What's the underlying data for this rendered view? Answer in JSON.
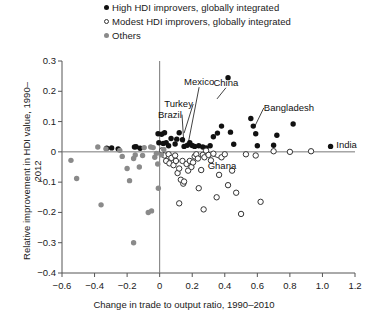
{
  "legend": {
    "position": "top",
    "items": [
      {
        "marker": "filled-circle-icon",
        "label": "High HDI improvers, globally integrated",
        "color": "#111111"
      },
      {
        "marker": "open-circle-icon",
        "label": "Modest HDI improvers, globally integrated",
        "color": "#ffffff"
      },
      {
        "marker": "gray-circle-icon",
        "label": "Others",
        "color": "#8a8a8a"
      }
    ]
  },
  "chart_data": {
    "type": "scatter",
    "title": "",
    "xlabel": "Change in trade to output ratio, 1990–2010",
    "ylabel": "Relative improvement in HDI value, 1990–2012",
    "xlim": [
      -0.6,
      1.2
    ],
    "ylim": [
      -0.4,
      0.3
    ],
    "xticks": [
      -0.6,
      -0.4,
      -0.2,
      0,
      0.2,
      0.4,
      0.6,
      0.8,
      1.0,
      1.2
    ],
    "xticklabels": [
      "−0.6",
      "−0.4",
      "−0.2",
      "0",
      "0.2",
      "0.4",
      "0.6",
      "0.8",
      "1.0",
      "1.2"
    ],
    "yticks": [
      0.3,
      0.2,
      0.1,
      0,
      -0.1,
      -0.2,
      -0.3,
      -0.4
    ],
    "yticklabels": [
      "0.3",
      "0.2",
      "0.1",
      "0",
      "−0.1",
      "−0.2",
      "−0.3",
      "−0.4"
    ],
    "grid": false,
    "reference_lines": {
      "x": 0,
      "y": 0
    },
    "series": [
      {
        "name": "High HDI improvers, globally integrated",
        "marker": "filled-circle",
        "color": "#111111",
        "points": [
          [
            -0.325,
            0.012
          ],
          [
            -0.295,
            0.013
          ],
          [
            -0.255,
            0.01
          ],
          [
            -0.155,
            0.016
          ],
          [
            -0.145,
            0.017
          ],
          [
            -0.12,
            0.012
          ],
          [
            -0.01,
            0.06
          ],
          [
            0.012,
            0.058
          ],
          [
            0.03,
            0.063
          ],
          [
            -0.005,
            0.03
          ],
          [
            0.022,
            0.028
          ],
          [
            0.04,
            0.03
          ],
          [
            0.055,
            0.02
          ],
          [
            0.07,
            0.044
          ],
          [
            0.095,
            0.026
          ],
          [
            0.105,
            0.042
          ],
          [
            0.12,
            0.063
          ],
          [
            0.14,
            0.04
          ],
          [
            0.15,
            0.018
          ],
          [
            0.17,
            0.022
          ],
          [
            0.185,
            0.03
          ],
          [
            0.2,
            0.021
          ],
          [
            0.215,
            0.018
          ],
          [
            0.24,
            0.02
          ],
          [
            0.265,
            0.016
          ],
          [
            0.285,
            0.013
          ],
          [
            0.31,
            0.02
          ],
          [
            0.33,
            0.05
          ],
          [
            0.355,
            0.062
          ],
          [
            0.38,
            0.085
          ],
          [
            0.42,
            0.245
          ],
          [
            0.435,
            0.065
          ],
          [
            0.455,
            0.025
          ],
          [
            0.56,
            0.11
          ],
          [
            0.575,
            0.085
          ],
          [
            0.59,
            0.06
          ],
          [
            0.6,
            0.02
          ],
          [
            0.7,
            0.022
          ],
          [
            0.72,
            0.055
          ],
          [
            0.82,
            0.092
          ],
          [
            1.05,
            0.018
          ]
        ]
      },
      {
        "name": "Modest HDI improvers, globally integrated",
        "marker": "open-circle",
        "color": "#ffffff",
        "points": [
          [
            0.015,
            0.005
          ],
          [
            0.03,
            -0.012
          ],
          [
            0.04,
            -0.03
          ],
          [
            0.055,
            -0.008
          ],
          [
            0.06,
            -0.038
          ],
          [
            0.072,
            -0.02
          ],
          [
            0.085,
            -0.044
          ],
          [
            0.095,
            -0.012
          ],
          [
            0.1,
            -0.03
          ],
          [
            0.11,
            -0.07
          ],
          [
            0.12,
            -0.055
          ],
          [
            0.13,
            -0.092
          ],
          [
            0.14,
            -0.03
          ],
          [
            0.145,
            -0.105
          ],
          [
            0.15,
            -0.098
          ],
          [
            0.165,
            -0.04
          ],
          [
            0.175,
            -0.062
          ],
          [
            0.185,
            -0.03
          ],
          [
            0.195,
            -0.05
          ],
          [
            0.205,
            -0.035
          ],
          [
            0.215,
            -0.015
          ],
          [
            0.225,
            -0.008
          ],
          [
            0.235,
            -0.022
          ],
          [
            0.24,
            -0.12
          ],
          [
            0.255,
            -0.06
          ],
          [
            0.265,
            -0.01
          ],
          [
            0.275,
            -0.018
          ],
          [
            0.285,
            0.004
          ],
          [
            0.3,
            -0.01
          ],
          [
            0.315,
            -0.028
          ],
          [
            0.33,
            -0.006
          ],
          [
            0.35,
            -0.15
          ],
          [
            0.365,
            -0.076
          ],
          [
            0.38,
            -0.018
          ],
          [
            0.4,
            -0.008
          ],
          [
            0.42,
            -0.11
          ],
          [
            0.445,
            -0.062
          ],
          [
            0.47,
            -0.135
          ],
          [
            0.5,
            -0.205
          ],
          [
            0.53,
            -0.008
          ],
          [
            0.59,
            -0.012
          ],
          [
            0.62,
            -0.165
          ],
          [
            0.7,
            0.002
          ],
          [
            0.8,
            0.0
          ],
          [
            0.93,
            0.002
          ],
          [
            0.12,
            -0.17
          ],
          [
            0.27,
            -0.19
          ]
        ]
      },
      {
        "name": "Others",
        "marker": "gray-circle",
        "color": "#8a8a8a",
        "points": [
          [
            -0.545,
            -0.028
          ],
          [
            -0.51,
            -0.088
          ],
          [
            -0.38,
            0.016
          ],
          [
            -0.33,
            0.01
          ],
          [
            -0.245,
            0.005
          ],
          [
            -0.23,
            -0.015
          ],
          [
            -0.2,
            -0.055
          ],
          [
            -0.185,
            -0.095
          ],
          [
            -0.16,
            -0.022
          ],
          [
            -0.15,
            -0.01
          ],
          [
            -0.125,
            -0.05
          ],
          [
            -0.105,
            -0.012
          ],
          [
            -0.095,
            0.014
          ],
          [
            -0.055,
            0.016
          ],
          [
            -0.04,
            0.014
          ],
          [
            -0.03,
            -0.018
          ],
          [
            -0.02,
            -0.005
          ],
          [
            -0.012,
            -0.04
          ],
          [
            -0.008,
            -0.12
          ],
          [
            -0.07,
            -0.2
          ],
          [
            -0.05,
            -0.195
          ],
          [
            -0.16,
            -0.3
          ],
          [
            -0.36,
            -0.175
          ],
          [
            0.01,
            -0.01
          ],
          [
            0.025,
            0.008
          ]
        ]
      }
    ],
    "annotations": [
      {
        "text": "Mexico",
        "label_x": 0.15,
        "label_y": 0.23,
        "point_x": 0.178,
        "point_y": 0.035
      },
      {
        "text": "China",
        "label_x": 0.33,
        "label_y": 0.228,
        "point_x": 0.352,
        "point_y": 0.175
      },
      {
        "text": "Turkey",
        "label_x": 0.028,
        "label_y": 0.158,
        "point_x": 0.15,
        "point_y": 0.062
      },
      {
        "text": "Brazil",
        "label_x": -0.01,
        "label_y": 0.123,
        "point_x": 0.148,
        "point_y": 0.03
      },
      {
        "text": "Bangladesh",
        "label_x": 0.64,
        "label_y": 0.145,
        "point_x": 0.585,
        "point_y": 0.085
      },
      {
        "text": "India",
        "label_x": 1.085,
        "label_y": 0.022,
        "point_x": 1.05,
        "point_y": 0.018
      },
      {
        "text": "Ghana",
        "label_x": 0.295,
        "label_y": -0.048,
        "point_x": 0.29,
        "point_y": -0.005
      }
    ]
  }
}
